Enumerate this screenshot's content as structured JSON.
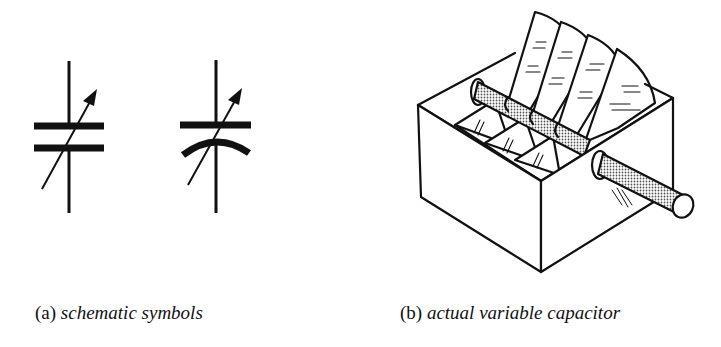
{
  "figure": {
    "panels": [
      {
        "id": "a",
        "tag": "(a)",
        "caption": "schematic symbols",
        "symbols": [
          "variable-capacitor-flat-plates",
          "variable-capacitor-curved-plate"
        ]
      },
      {
        "id": "b",
        "tag": "(b)",
        "caption": "actual variable capacitor",
        "parts": [
          "box-frame",
          "fixed-plates",
          "rotating-plates",
          "shaft"
        ]
      }
    ],
    "colors": {
      "ink": "#111111",
      "background": "#ffffff",
      "stipple": "#8a8a8a"
    }
  }
}
